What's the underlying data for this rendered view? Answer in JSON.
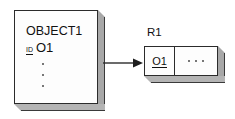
{
  "diagram": {
    "colors": {
      "stroke": "#2b2b2b",
      "face": "#fdfdfd",
      "side_shade": "#a8a8a8",
      "bottom_shade": "#b4b4b4",
      "text": "#111111",
      "background": "#ffffff"
    },
    "object_card": {
      "title": "OBJECT1",
      "id_key": "ID",
      "id_value": "O1",
      "ellipsis_dots": 3
    },
    "arrow": {
      "icon": "arrow-right-icon",
      "direction": "right"
    },
    "relation": {
      "label": "R1",
      "cells": [
        {
          "text": "O1",
          "underlined": true
        },
        {
          "text": "...",
          "underlined": false
        }
      ],
      "rest_dots": 3
    }
  }
}
